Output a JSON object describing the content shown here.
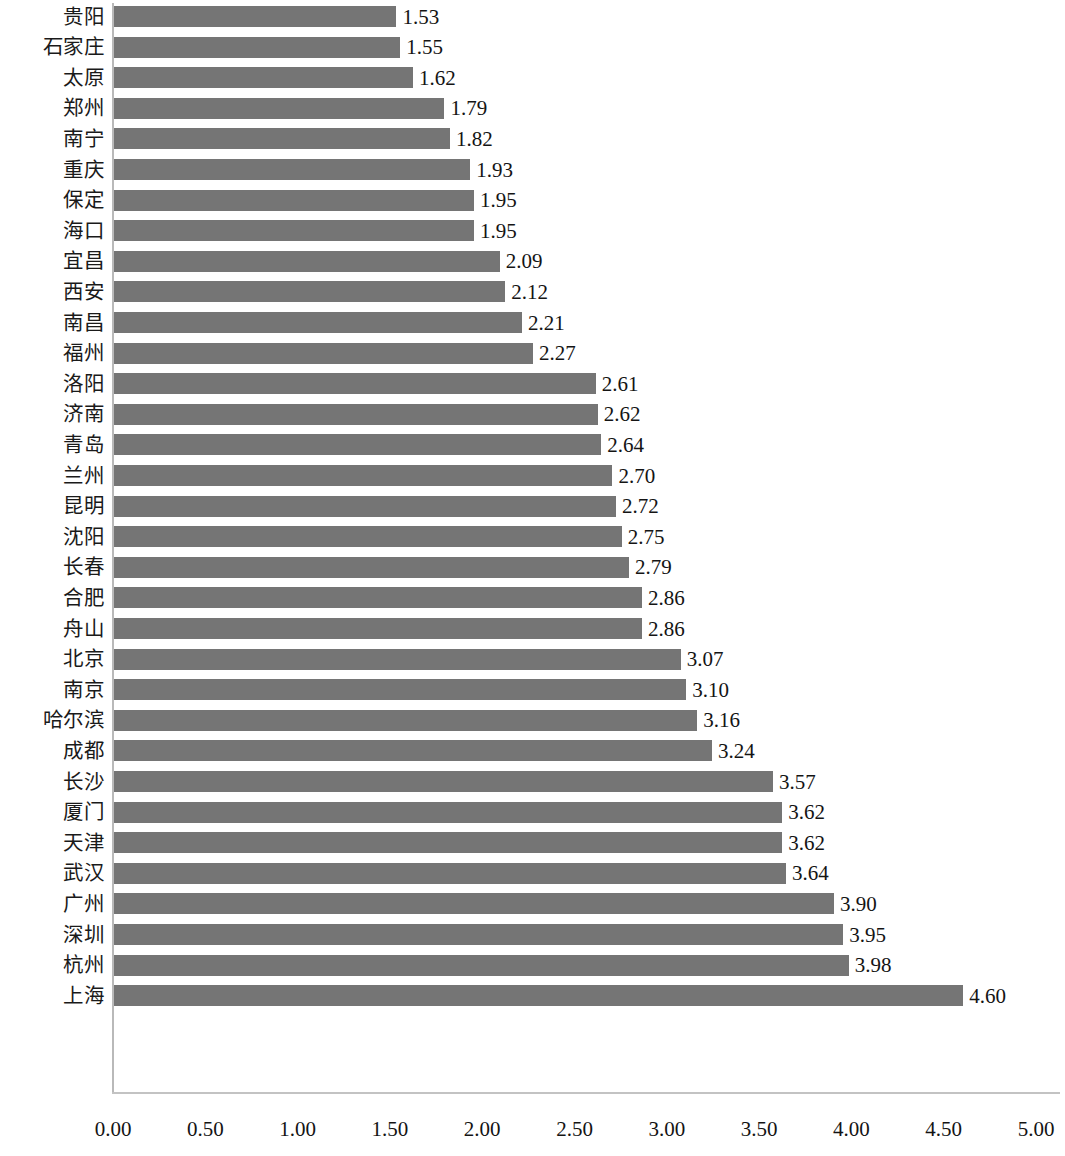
{
  "chart_data": {
    "type": "bar",
    "orientation": "horizontal",
    "title": "",
    "subtitle": "",
    "xlabel": "",
    "ylabel": "",
    "xlim": [
      0,
      5
    ],
    "xticks": [
      "0.00",
      "0.50",
      "1.00",
      "1.50",
      "2.00",
      "2.50",
      "3.00",
      "3.50",
      "4.00",
      "4.50",
      "5.00"
    ],
    "xtick_values": [
      0,
      0.5,
      1,
      1.5,
      2,
      2.5,
      3,
      3.5,
      4,
      4.5,
      5
    ],
    "grid": false,
    "legend": null,
    "bar_color": "#757575",
    "categories": [
      "贵阳",
      "石家庄",
      "太原",
      "郑州",
      "南宁",
      "重庆",
      "保定",
      "海口",
      "宜昌",
      "西安",
      "南昌",
      "福州",
      "洛阳",
      "济南",
      "青岛",
      "兰州",
      "昆明",
      "沈阳",
      "长春",
      "合肥",
      "舟山",
      "北京",
      "南京",
      "哈尔滨",
      "成都",
      "长沙",
      "厦门",
      "天津",
      "武汉",
      "广州",
      "深圳",
      "杭州",
      "上海"
    ],
    "values": [
      1.53,
      1.55,
      1.62,
      1.79,
      1.82,
      1.93,
      1.95,
      1.95,
      2.09,
      2.12,
      2.21,
      2.27,
      2.61,
      2.62,
      2.64,
      2.7,
      2.72,
      2.75,
      2.79,
      2.86,
      2.86,
      3.07,
      3.1,
      3.16,
      3.24,
      3.57,
      3.62,
      3.62,
      3.64,
      3.9,
      3.95,
      3.98,
      4.6
    ],
    "value_labels": [
      "1.53",
      "1.55",
      "1.62",
      "1.79",
      "1.82",
      "1.93",
      "1.95",
      "1.95",
      "2.09",
      "2.12",
      "2.21",
      "2.27",
      "2.61",
      "2.62",
      "2.64",
      "2.70",
      "2.72",
      "2.75",
      "2.79",
      "2.86",
      "2.86",
      "3.07",
      "3.10",
      "3.16",
      "3.24",
      "3.57",
      "3.62",
      "3.62",
      "3.64",
      "3.90",
      "3.95",
      "3.98",
      "4.60"
    ]
  }
}
